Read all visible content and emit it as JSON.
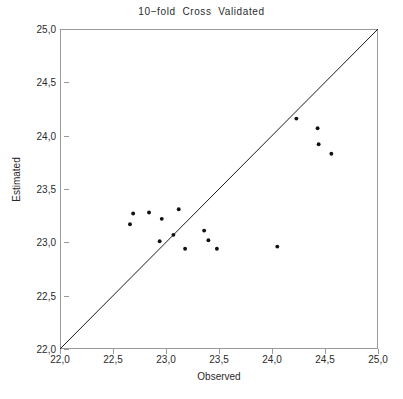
{
  "chart_data": {
    "type": "scatter",
    "title": "10−fold  Cross  Validated",
    "xlabel": "Observed",
    "ylabel": "Estimated",
    "xlim": [
      22.0,
      25.0
    ],
    "ylim": [
      22.0,
      25.0
    ],
    "grid": false,
    "legend": "none",
    "decimal_separator": ",",
    "xticks": [
      22.0,
      22.5,
      23.0,
      23.5,
      24.0,
      24.5,
      25.0
    ],
    "yticks": [
      22.0,
      22.5,
      23.0,
      23.5,
      24.0,
      24.5,
      25.0
    ],
    "xtick_labels": [
      "22,0",
      "22,5",
      "23,0",
      "23,5",
      "24,0",
      "24,5",
      "25,0"
    ],
    "ytick_labels": [
      "22,0",
      "22,5",
      "23,0",
      "23,5",
      "24,0",
      "24,5",
      "25,0"
    ],
    "reference_line": {
      "name": "identity-line",
      "equation": "y = x",
      "from": [
        22.0,
        22.0
      ],
      "to": [
        25.0,
        25.0
      ],
      "color": "#1a1a1a"
    },
    "series": [
      {
        "name": "cross-validated-predictions",
        "marker": "filled-circle",
        "marker_color": "#111111",
        "marker_size_px": 3,
        "x": [
          22.66,
          22.69,
          22.84,
          22.94,
          22.96,
          23.07,
          23.12,
          23.18,
          23.36,
          23.4,
          23.48,
          24.05,
          24.23,
          24.43,
          24.44,
          24.56
        ],
        "y": [
          23.17,
          23.27,
          23.28,
          23.01,
          23.22,
          23.07,
          23.31,
          22.94,
          23.11,
          23.02,
          22.94,
          22.96,
          24.16,
          24.07,
          23.92,
          23.83
        ],
        "points": [
          {
            "x": 22.66,
            "y": 23.17
          },
          {
            "x": 22.69,
            "y": 23.27
          },
          {
            "x": 22.84,
            "y": 23.28
          },
          {
            "x": 22.94,
            "y": 23.01
          },
          {
            "x": 22.96,
            "y": 23.22
          },
          {
            "x": 23.07,
            "y": 23.07
          },
          {
            "x": 23.12,
            "y": 23.31
          },
          {
            "x": 23.18,
            "y": 22.94
          },
          {
            "x": 23.36,
            "y": 23.11
          },
          {
            "x": 23.4,
            "y": 23.02
          },
          {
            "x": 23.48,
            "y": 22.94
          },
          {
            "x": 24.05,
            "y": 22.96
          },
          {
            "x": 24.23,
            "y": 24.16
          },
          {
            "x": 24.43,
            "y": 24.07
          },
          {
            "x": 24.44,
            "y": 23.92
          },
          {
            "x": 24.56,
            "y": 23.83
          }
        ]
      }
    ]
  },
  "colors": {
    "frame": "#9a9a9a",
    "text": "#2a2a2a",
    "marker": "#111111",
    "line": "#1a1a1a",
    "background": "#ffffff"
  }
}
